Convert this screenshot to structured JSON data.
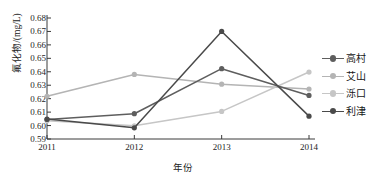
{
  "chart_data": {
    "type": "line",
    "title": "",
    "xlabel": "年份",
    "ylabel": "氟化物/(mg/L)",
    "categories": [
      "2011",
      "2012",
      "2013",
      "2014"
    ],
    "x": [
      2011,
      2012,
      2013,
      2014
    ],
    "ylim": [
      0.59,
      0.68
    ],
    "ytick_labels": [
      "0.59",
      "0.60",
      "0.61",
      "0.62",
      "0.63",
      "0.64",
      "0.65",
      "0.66",
      "0.67",
      "0.68"
    ],
    "ytick_values": [
      0.59,
      0.6,
      0.61,
      0.62,
      0.63,
      0.64,
      0.65,
      0.66,
      0.67,
      0.68
    ],
    "grid": false,
    "legend_position": "right",
    "series": [
      {
        "name": "高村",
        "values": [
          0.6045,
          0.6088,
          0.6423,
          0.6224
        ],
        "color": "#5e5e5e"
      },
      {
        "name": "艾山",
        "values": [
          0.6218,
          0.638,
          0.6308,
          0.6272
        ],
        "color": "#b4b4b4"
      },
      {
        "name": "泺口",
        "values": [
          0.6035,
          0.5998,
          0.6105,
          0.6398
        ],
        "color": "#c6c6c6"
      },
      {
        "name": "利津",
        "values": [
          0.6048,
          0.5983,
          0.67,
          0.607
        ],
        "color": "#4a4a4a"
      }
    ]
  },
  "axes": {
    "x_title": "年份",
    "y_title": "氟化物/(mg/L)",
    "x_labels": [
      "2011",
      "2012",
      "2013",
      "2014"
    ],
    "y_labels": [
      "0.68",
      "0.67",
      "0.66",
      "0.65",
      "0.64",
      "0.63",
      "0.62",
      "0.61",
      "0.60",
      "0.59"
    ]
  },
  "legend": {
    "items": [
      {
        "label": "高村",
        "color": "#5e5e5e"
      },
      {
        "label": "艾山",
        "color": "#b4b4b4"
      },
      {
        "label": "泺口",
        "color": "#c6c6c6"
      },
      {
        "label": "利津",
        "color": "#4a4a4a"
      }
    ]
  },
  "style": {
    "axis_color": "#3a3a3a",
    "text_color": "#1e1e1e",
    "background": "#ffffff"
  }
}
